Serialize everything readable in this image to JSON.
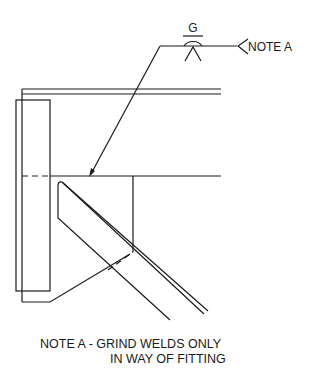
{
  "weld_symbol": {
    "finish_letter": "G",
    "reference_note": "NOTE A"
  },
  "note": {
    "line1": "NOTE A - GRIND WELDS ONLY",
    "line2": "IN WAY OF FITTING"
  },
  "colors": {
    "line": "#1a1a1a",
    "background": "#ffffff"
  }
}
